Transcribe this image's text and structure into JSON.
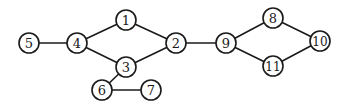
{
  "graph": {
    "nodes": [
      {
        "id": "1",
        "label": "1",
        "x": 126,
        "y": 20
      },
      {
        "id": "2",
        "label": "2",
        "x": 176,
        "y": 43
      },
      {
        "id": "3",
        "label": "3",
        "x": 126,
        "y": 67
      },
      {
        "id": "4",
        "label": "4",
        "x": 77,
        "y": 43
      },
      {
        "id": "5",
        "label": "5",
        "x": 29,
        "y": 43
      },
      {
        "id": "6",
        "label": "6",
        "x": 102,
        "y": 90
      },
      {
        "id": "7",
        "label": "7",
        "x": 151,
        "y": 90
      },
      {
        "id": "8",
        "label": "8",
        "x": 273,
        "y": 18
      },
      {
        "id": "9",
        "label": "9",
        "x": 226,
        "y": 43
      },
      {
        "id": "10",
        "label": "10",
        "x": 320,
        "y": 41
      },
      {
        "id": "11",
        "label": "11",
        "x": 273,
        "y": 66
      }
    ],
    "edges": [
      [
        "5",
        "4"
      ],
      [
        "4",
        "1"
      ],
      [
        "4",
        "3"
      ],
      [
        "1",
        "2"
      ],
      [
        "3",
        "2"
      ],
      [
        "3",
        "6"
      ],
      [
        "6",
        "7"
      ],
      [
        "2",
        "9"
      ],
      [
        "9",
        "8"
      ],
      [
        "9",
        "11"
      ],
      [
        "8",
        "10"
      ],
      [
        "11",
        "10"
      ]
    ],
    "node_radius": 10,
    "colors": {
      "stroke": "#1a1a1a",
      "fill": "#ffffff"
    }
  }
}
